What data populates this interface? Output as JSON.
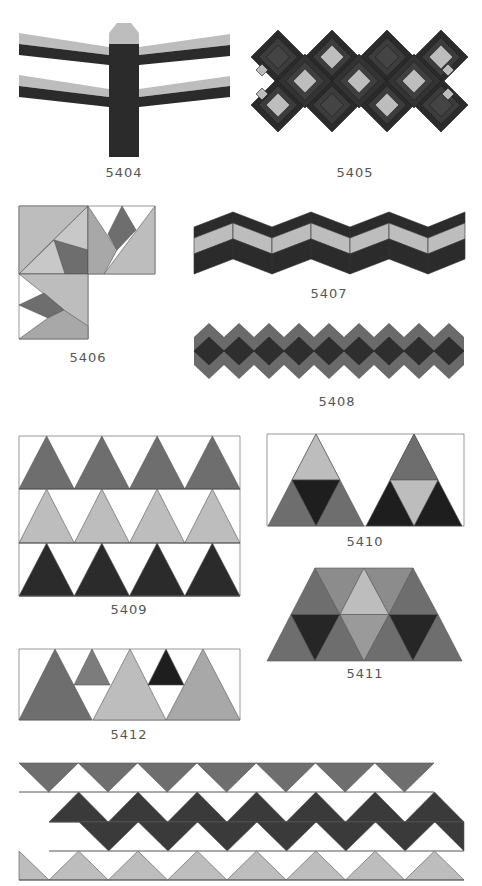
{
  "colors": {
    "dark": "#2b2b2b",
    "mid": "#6e6e6e",
    "light": "#bdbdbd",
    "stroke": "#555555",
    "white": "#ffffff"
  },
  "patterns": [
    {
      "id": "5404",
      "label": "5404",
      "label_pos": [
        124,
        172
      ]
    },
    {
      "id": "5405",
      "label": "5405",
      "label_pos": [
        355,
        172
      ]
    },
    {
      "id": "5406",
      "label": "5406",
      "label_pos": [
        88,
        357
      ]
    },
    {
      "id": "5407",
      "label": "5407",
      "label_pos": [
        329,
        292
      ]
    },
    {
      "id": "5408",
      "label": "5408",
      "label_pos": [
        337,
        400
      ]
    },
    {
      "id": "5409",
      "label": "5409",
      "label_pos": [
        129,
        608
      ]
    },
    {
      "id": "5410",
      "label": "5410",
      "label_pos": [
        365,
        540
      ]
    },
    {
      "id": "5411",
      "label": "5411",
      "label_pos": [
        365,
        672
      ]
    },
    {
      "id": "5412",
      "label": "5412",
      "label_pos": [
        129,
        733
      ]
    }
  ]
}
